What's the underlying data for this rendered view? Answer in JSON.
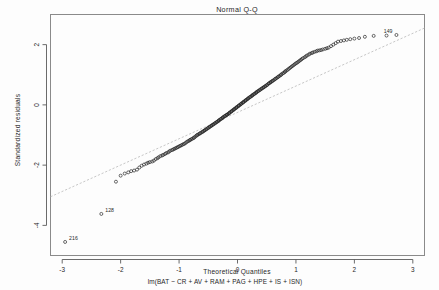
{
  "chart_data": {
    "type": "scatter",
    "title": "Normal Q-Q",
    "xlabel": "Theoretical Quantiles",
    "subtitle": "lm(BAT ~ CR + AV + RAM + PAG + HPE + IS + ISN)",
    "ylabel": "Standardized residuals",
    "xlim": [
      -3.2,
      3.2
    ],
    "ylim": [
      -5.0,
      3.0
    ],
    "xticks": [
      -3,
      -2,
      -1,
      0,
      1,
      2,
      3
    ],
    "xtick_labels": [
      "-3",
      "-2",
      "-1",
      "0",
      "1",
      "2",
      "3"
    ],
    "yticks": [
      2,
      0,
      -2,
      -4
    ],
    "ytick_labels": [
      "2",
      "0",
      "-2",
      "-4"
    ],
    "grid": false,
    "legend": "none",
    "reference_line": {
      "label": "qq-line",
      "x0": -3.2,
      "y0": -3.05,
      "x1": 3.2,
      "y1": 2.55
    },
    "point_marker": "open-circle",
    "annotations": [
      {
        "label": "128",
        "x": -2.33,
        "y": -3.62
      },
      {
        "label": "216",
        "x": -2.95,
        "y": -4.55
      },
      {
        "label": "149",
        "x": 2.72,
        "y": 2.32
      }
    ],
    "x": [
      -2.95,
      -2.33,
      -2.08,
      -2.0,
      -1.93,
      -1.87,
      -1.82,
      -1.77,
      -1.72,
      -1.68,
      -1.64,
      -1.6,
      -1.56,
      -1.53,
      -1.5,
      -1.46,
      -1.43,
      -1.4,
      -1.37,
      -1.35,
      -1.32,
      -1.29,
      -1.27,
      -1.24,
      -1.22,
      -1.19,
      -1.17,
      -1.15,
      -1.12,
      -1.1,
      -1.08,
      -1.06,
      -1.04,
      -1.02,
      -1.0,
      -0.98,
      -0.96,
      -0.94,
      -0.92,
      -0.9,
      -0.88,
      -0.86,
      -0.84,
      -0.82,
      -0.81,
      -0.79,
      -0.77,
      -0.75,
      -0.74,
      -0.72,
      -0.7,
      -0.69,
      -0.67,
      -0.65,
      -0.64,
      -0.62,
      -0.6,
      -0.59,
      -0.57,
      -0.56,
      -0.54,
      -0.53,
      -0.51,
      -0.5,
      -0.48,
      -0.47,
      -0.45,
      -0.44,
      -0.42,
      -0.41,
      -0.39,
      -0.38,
      -0.36,
      -0.35,
      -0.33,
      -0.32,
      -0.31,
      -0.29,
      -0.28,
      -0.26,
      -0.25,
      -0.24,
      -0.22,
      -0.21,
      -0.19,
      -0.18,
      -0.17,
      -0.15,
      -0.14,
      -0.13,
      -0.11,
      -0.1,
      -0.09,
      -0.07,
      -0.06,
      -0.05,
      -0.03,
      -0.02,
      -0.01,
      0.01,
      0.02,
      0.03,
      0.05,
      0.06,
      0.07,
      0.09,
      0.1,
      0.11,
      0.13,
      0.14,
      0.15,
      0.17,
      0.18,
      0.19,
      0.21,
      0.22,
      0.24,
      0.25,
      0.26,
      0.28,
      0.29,
      0.31,
      0.32,
      0.33,
      0.35,
      0.36,
      0.38,
      0.39,
      0.41,
      0.42,
      0.44,
      0.45,
      0.47,
      0.48,
      0.5,
      0.51,
      0.53,
      0.54,
      0.56,
      0.57,
      0.59,
      0.6,
      0.62,
      0.64,
      0.65,
      0.67,
      0.69,
      0.7,
      0.72,
      0.74,
      0.75,
      0.77,
      0.79,
      0.81,
      0.82,
      0.84,
      0.86,
      0.88,
      0.9,
      0.92,
      0.94,
      0.96,
      0.98,
      1.0,
      1.02,
      1.04,
      1.06,
      1.08,
      1.1,
      1.12,
      1.15,
      1.17,
      1.19,
      1.22,
      1.24,
      1.27,
      1.29,
      1.32,
      1.35,
      1.37,
      1.4,
      1.43,
      1.46,
      1.5,
      1.53,
      1.56,
      1.6,
      1.64,
      1.68,
      1.72,
      1.77,
      1.82,
      1.87,
      1.93,
      2.0,
      2.08,
      2.18,
      2.33,
      2.55,
      2.72
    ],
    "y": [
      -4.55,
      -3.62,
      -2.55,
      -2.35,
      -2.28,
      -2.24,
      -2.2,
      -2.18,
      -2.15,
      -2.08,
      -2.02,
      -1.98,
      -1.95,
      -1.92,
      -1.9,
      -1.88,
      -1.85,
      -1.8,
      -1.77,
      -1.74,
      -1.7,
      -1.68,
      -1.66,
      -1.63,
      -1.6,
      -1.58,
      -1.55,
      -1.52,
      -1.5,
      -1.48,
      -1.46,
      -1.44,
      -1.42,
      -1.4,
      -1.38,
      -1.36,
      -1.34,
      -1.32,
      -1.3,
      -1.28,
      -1.25,
      -1.22,
      -1.2,
      -1.18,
      -1.16,
      -1.14,
      -1.12,
      -1.1,
      -1.08,
      -1.05,
      -1.02,
      -1.0,
      -0.98,
      -0.96,
      -0.94,
      -0.92,
      -0.9,
      -0.88,
      -0.86,
      -0.84,
      -0.82,
      -0.8,
      -0.78,
      -0.76,
      -0.74,
      -0.72,
      -0.7,
      -0.68,
      -0.66,
      -0.64,
      -0.62,
      -0.6,
      -0.58,
      -0.56,
      -0.54,
      -0.52,
      -0.5,
      -0.48,
      -0.46,
      -0.44,
      -0.42,
      -0.4,
      -0.38,
      -0.36,
      -0.34,
      -0.33,
      -0.31,
      -0.29,
      -0.27,
      -0.25,
      -0.23,
      -0.21,
      -0.19,
      -0.17,
      -0.15,
      -0.13,
      -0.11,
      -0.09,
      -0.07,
      -0.05,
      -0.03,
      -0.01,
      0.01,
      0.03,
      0.05,
      0.07,
      0.09,
      0.11,
      0.13,
      0.15,
      0.17,
      0.19,
      0.21,
      0.23,
      0.25,
      0.27,
      0.29,
      0.31,
      0.33,
      0.35,
      0.37,
      0.39,
      0.41,
      0.43,
      0.45,
      0.47,
      0.49,
      0.51,
      0.53,
      0.55,
      0.57,
      0.59,
      0.61,
      0.63,
      0.65,
      0.67,
      0.7,
      0.72,
      0.74,
      0.76,
      0.78,
      0.8,
      0.82,
      0.85,
      0.87,
      0.89,
      0.92,
      0.94,
      0.96,
      0.99,
      1.01,
      1.04,
      1.06,
      1.09,
      1.12,
      1.14,
      1.17,
      1.2,
      1.23,
      1.26,
      1.29,
      1.32,
      1.35,
      1.38,
      1.4,
      1.43,
      1.46,
      1.49,
      1.52,
      1.55,
      1.58,
      1.61,
      1.64,
      1.67,
      1.7,
      1.72,
      1.74,
      1.76,
      1.78,
      1.8,
      1.81,
      1.82,
      1.84,
      1.86,
      1.88,
      1.9,
      1.95,
      2.0,
      2.05,
      2.1,
      2.12,
      2.14,
      2.16,
      2.18,
      2.2,
      2.22,
      2.26,
      2.29,
      2.3,
      2.32
    ]
  },
  "axes": {
    "title": "Normal Q-Q",
    "xlabel": "Theoretical Quantiles",
    "subtitle": "lm(BAT ~ CR + AV + RAM + PAG + HPE + IS + ISN)",
    "ylabel": "Standardized residuals"
  }
}
